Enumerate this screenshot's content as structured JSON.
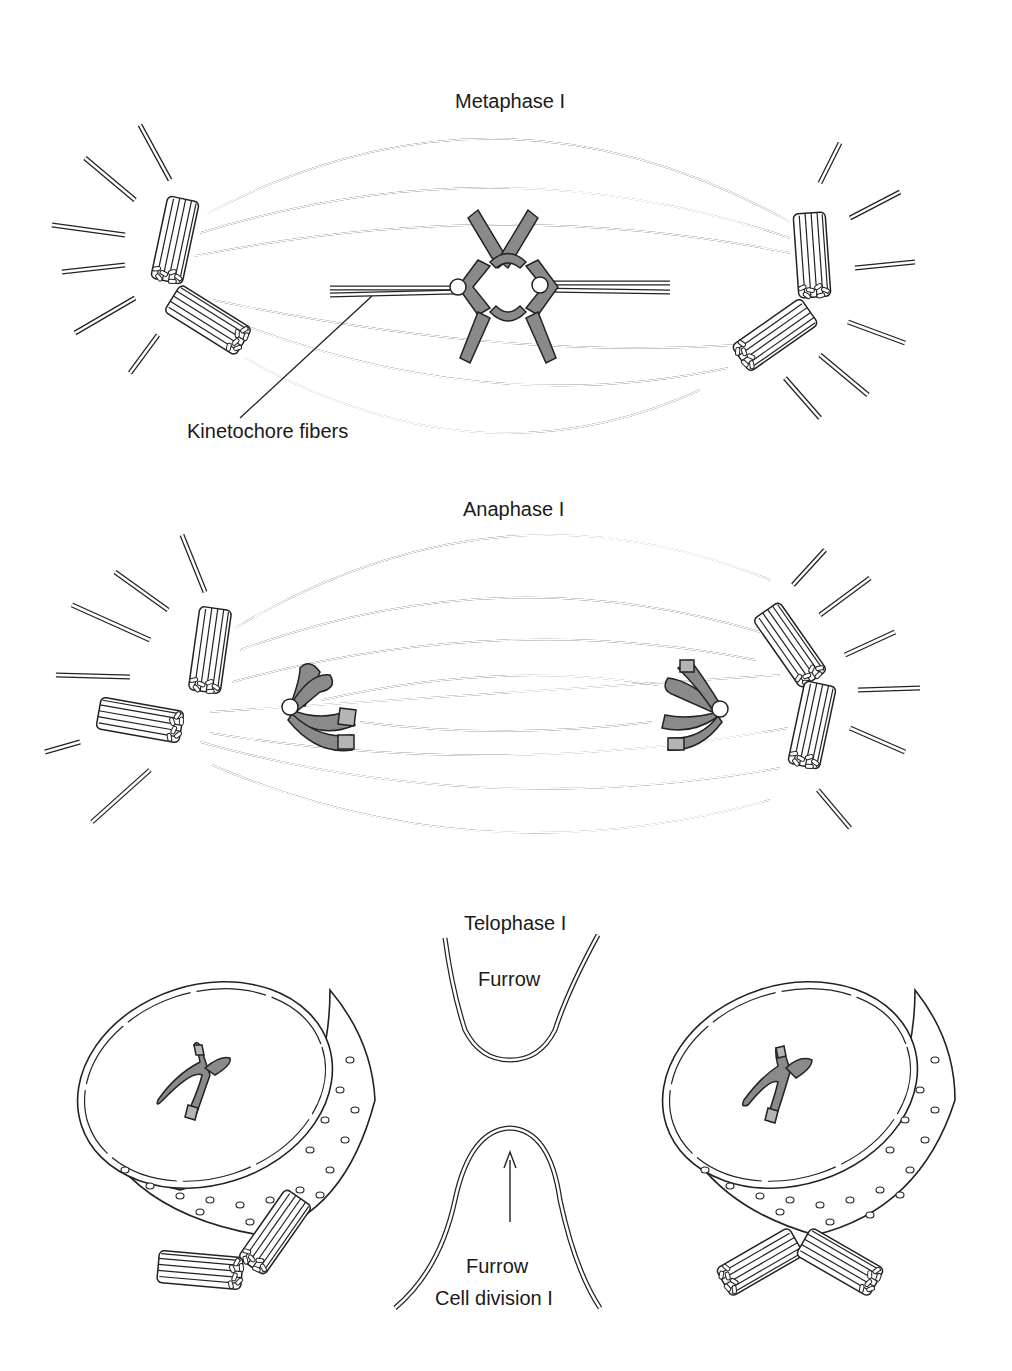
{
  "figure": {
    "panels": [
      {
        "id": "metaphase",
        "title": "Metaphase I",
        "annotations": [
          "Kinetochore fibers"
        ],
        "elements": [
          "spindle-fibers",
          "centriole-pair-left",
          "centriole-pair-right",
          "tetrad-chromosomes",
          "astral-rays"
        ]
      },
      {
        "id": "anaphase",
        "title": "Anaphase I",
        "annotations": [],
        "elements": [
          "spindle-fibers",
          "centriole-pair-left",
          "centriole-pair-right",
          "separating-chromosomes",
          "astral-rays"
        ]
      },
      {
        "id": "telophase",
        "title": "Telophase I",
        "annotations": [
          "Furrow",
          "Furrow",
          "Cell division I"
        ],
        "elements": [
          "nucleus-left",
          "nucleus-right",
          "cleavage-furrow-top",
          "cleavage-furrow-bottom",
          "arrow-up",
          "centriole-pair-left",
          "centriole-pair-right"
        ]
      }
    ]
  },
  "labels": {
    "metaphase_title": "Metaphase I",
    "kinetochore_fibers": "Kinetochore fibers",
    "anaphase_title": "Anaphase I",
    "telophase_title": "Telophase I",
    "furrow_top": "Furrow",
    "furrow_bottom": "Furrow",
    "cell_division": "Cell division I"
  },
  "colors": {
    "line": "#222222",
    "chromosome_fill": "#8a8a8a",
    "chromosome_tip": "#b5b5b5",
    "background": "#ffffff"
  }
}
